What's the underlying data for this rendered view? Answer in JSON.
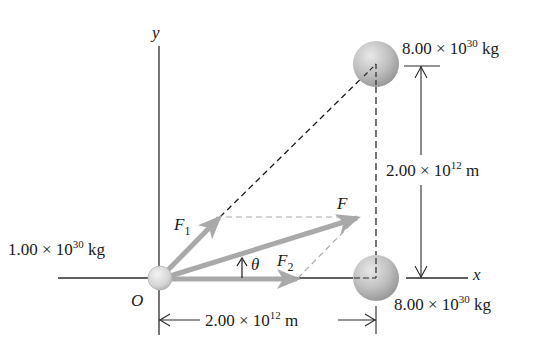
{
  "diagram": {
    "axes": {
      "x_label": "x",
      "y_label": "y",
      "origin_label": "O"
    },
    "masses": [
      {
        "id": "m-origin",
        "label_mant": "1.00 × 10",
        "label_exp": "30",
        "label_unit": " kg",
        "position": "origin"
      },
      {
        "id": "m-top-right",
        "label_mant": "8.00 × 10",
        "label_exp": "30",
        "label_unit": " kg",
        "position": "top-right"
      },
      {
        "id": "m-bottom-right",
        "label_mant": "8.00 × 10",
        "label_exp": "30",
        "label_unit": " kg",
        "position": "bottom-right"
      }
    ],
    "forces": {
      "F1": {
        "symbol": "F",
        "subscript": "1"
      },
      "F2": {
        "symbol": "F",
        "subscript": "2"
      },
      "F": {
        "symbol": "F"
      },
      "angle": "θ"
    },
    "dimensions": {
      "horizontal": {
        "mant": "2.00 × 10",
        "exp": "12",
        "unit": " m"
      },
      "vertical": {
        "mant": "2.00 × 10",
        "exp": "12",
        "unit": " m"
      }
    },
    "colors": {
      "axis": "#2a2a2a",
      "arrow": "#a9a9a9",
      "dashed_black": "#1a1a1a",
      "dashed_gray": "#a9a9a9",
      "mass_light": "#efefef",
      "mass_dark": "#9c9c9c"
    }
  }
}
